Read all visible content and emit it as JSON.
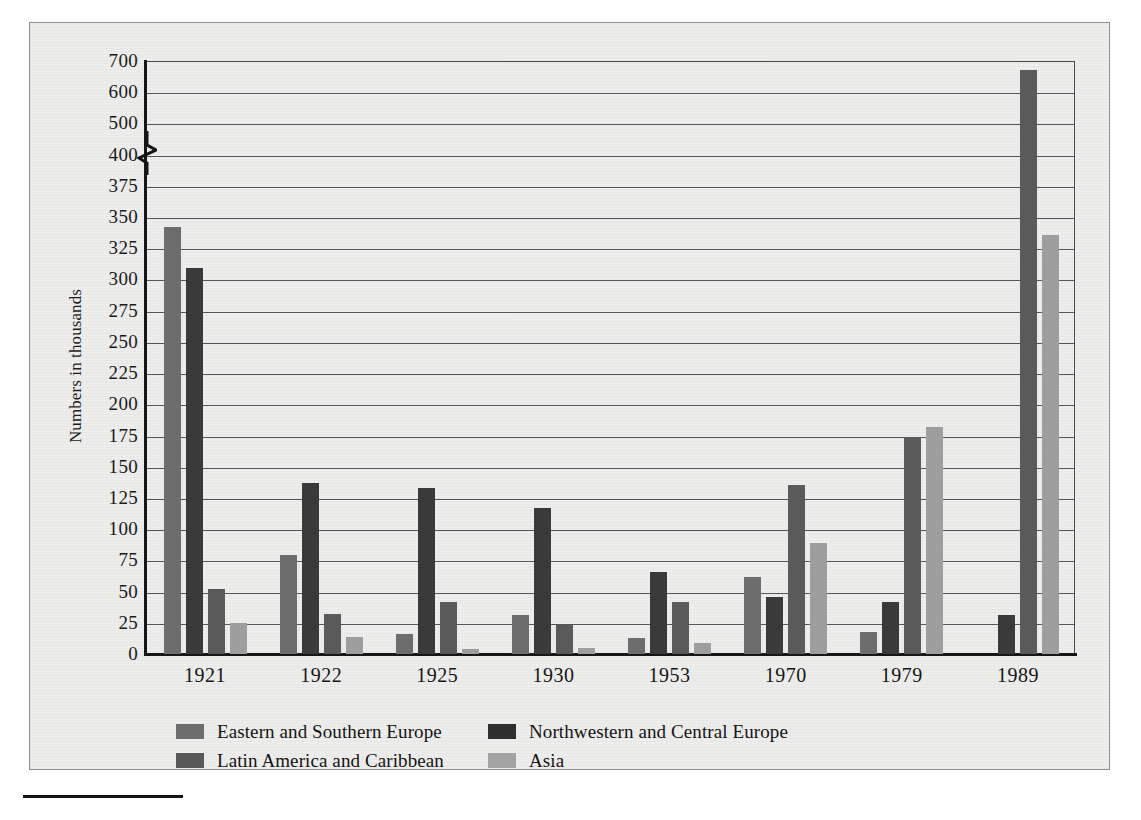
{
  "chart_data": {
    "type": "bar",
    "title": "",
    "xlabel": "",
    "ylabel": "Numbers in thousands",
    "categories": [
      "1921",
      "1922",
      "1925",
      "1930",
      "1953",
      "1970",
      "1979",
      "1989"
    ],
    "series": [
      {
        "name": "Eastern and Southern Europe",
        "color": "#6d6d6d",
        "values": [
          342,
          79,
          16,
          31,
          13,
          62,
          18,
          0
        ]
      },
      {
        "name": "Northwestern and Central Europe",
        "color": "#2f2f2f",
        "values": [
          309,
          137,
          133,
          117,
          66,
          46,
          42,
          31
        ]
      },
      {
        "name": "Latin America and Caribbean",
        "color": "#585858",
        "values": [
          52,
          32,
          42,
          23,
          42,
          135,
          174,
          672
        ]
      },
      {
        "name": "Asia",
        "color": "#a3a3a3",
        "values": [
          25,
          14,
          4,
          5,
          9,
          89,
          182,
          336
        ]
      }
    ],
    "ytick_labels": [
      "700",
      "600",
      "500",
      "400",
      "375",
      "350",
      "325",
      "300",
      "275",
      "250",
      "225",
      "200",
      "175",
      "150",
      "125",
      "100",
      "75",
      "50",
      "25",
      "0"
    ],
    "ytick_values": [
      700,
      600,
      500,
      400,
      375,
      350,
      325,
      300,
      275,
      250,
      225,
      200,
      175,
      150,
      125,
      100,
      75,
      50,
      25,
      0
    ],
    "axis_break": {
      "between": [
        400,
        500
      ],
      "present": true
    },
    "ylim": [
      0,
      700
    ],
    "grid": true,
    "legend_position": "bottom-left",
    "legend_columns": 2
  },
  "legend": {
    "rows": [
      {
        "left": {
          "label": "Eastern and Southern Europe",
          "swatch": "s0"
        },
        "right": {
          "label": "Northwestern and Central Europe",
          "swatch": "s1"
        }
      },
      {
        "left": {
          "label": "Latin America and Caribbean",
          "swatch": "s2"
        },
        "right": {
          "label": "Asia",
          "swatch": "s3"
        }
      }
    ]
  }
}
